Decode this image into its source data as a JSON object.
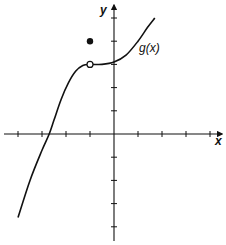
{
  "chart_data": {
    "type": "line",
    "title": "",
    "xlabel": "x",
    "ylabel": "y",
    "xlim": [
      -4,
      4
    ],
    "ylim": [
      -4,
      5
    ],
    "grid": false,
    "x_ticks": [
      -4,
      -3,
      -2,
      -1,
      1,
      2,
      3,
      4
    ],
    "y_ticks": [
      -4,
      -3,
      -2,
      -1,
      1,
      2,
      3,
      4,
      5
    ],
    "series": [
      {
        "name": "g(x)",
        "points": [
          [
            -4.0,
            -3.6
          ],
          [
            -3.5,
            -2.0
          ],
          [
            -3.0,
            -0.7
          ],
          [
            -2.7,
            0.0
          ],
          [
            -2.5,
            0.6
          ],
          [
            -2.2,
            1.5
          ],
          [
            -1.9,
            2.2
          ],
          [
            -1.6,
            2.7
          ],
          [
            -1.3,
            2.95
          ],
          [
            -1.0,
            3.0
          ],
          [
            -0.5,
            3.0
          ],
          [
            0.0,
            3.1
          ],
          [
            0.5,
            3.4
          ],
          [
            1.0,
            4.0
          ],
          [
            1.4,
            4.6
          ],
          [
            1.7,
            5.0
          ]
        ]
      }
    ],
    "annotations": [
      {
        "type": "open-circle",
        "x": -1,
        "y": 3,
        "note": "hole in g(x) at x = -1"
      },
      {
        "type": "filled-dot",
        "x": -1,
        "y": 4,
        "note": "g(-1) = 4"
      },
      {
        "type": "label",
        "text": "g(x)",
        "x": 1.1,
        "y": 3.7
      }
    ]
  },
  "labels": {
    "x_axis": "x",
    "y_axis": "y",
    "curve": "g(x)"
  }
}
